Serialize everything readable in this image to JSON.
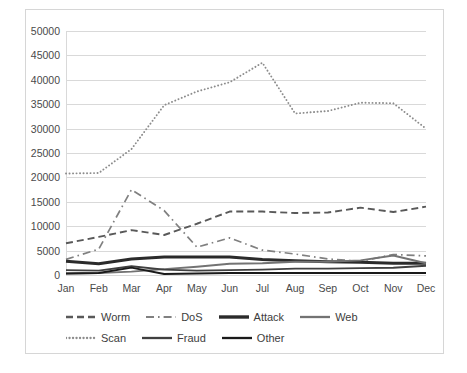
{
  "chart_data": {
    "type": "line",
    "title": "",
    "xlabel": "",
    "ylabel": "",
    "ylim": [
      0,
      50000
    ],
    "ytick_step": 5000,
    "yticks": [
      "0",
      "5000",
      "10000",
      "15000",
      "20000",
      "25000",
      "30000",
      "35000",
      "40000",
      "45000",
      "50000"
    ],
    "grid": true,
    "legend_position": "bottom",
    "categories": [
      "Jan",
      "Feb",
      "Mar",
      "Apr",
      "May",
      "Jun",
      "Jul",
      "Aug",
      "Sep",
      "Oct",
      "Nov",
      "Dec"
    ],
    "series": [
      {
        "name": "Worm",
        "style": "dashed",
        "color": "#595959",
        "values": [
          6500,
          7800,
          9200,
          8200,
          10500,
          13000,
          13000,
          12700,
          12800,
          13800,
          12900,
          14000
        ]
      },
      {
        "name": "DoS",
        "style": "dash-dot",
        "color": "#808080",
        "values": [
          3200,
          5300,
          17500,
          13200,
          5700,
          7600,
          5100,
          4300,
          3300,
          2800,
          4200,
          3900
        ]
      },
      {
        "name": "Attack",
        "style": "solid-thick",
        "color": "#2b2b2b",
        "values": [
          2800,
          2300,
          3300,
          3700,
          3700,
          3700,
          3200,
          2900,
          2700,
          2600,
          2400,
          2400
        ]
      },
      {
        "name": "Web",
        "style": "solid",
        "color": "#737373",
        "values": [
          300,
          400,
          700,
          1200,
          1700,
          2300,
          2400,
          2700,
          2700,
          3000,
          4000,
          2400
        ]
      },
      {
        "name": "Scan",
        "style": "dotted",
        "color": "#8c8c8c",
        "values": [
          20800,
          20900,
          25800,
          34800,
          37600,
          39500,
          43500,
          33100,
          33600,
          35300,
          35200,
          30000
        ]
      },
      {
        "name": "Fraud",
        "style": "solid",
        "color": "#404040",
        "values": [
          1000,
          900,
          1800,
          1100,
          900,
          1000,
          1100,
          1300,
          1300,
          1400,
          1500,
          1900
        ]
      },
      {
        "name": "Other",
        "style": "solid",
        "color": "#1a1a1a",
        "values": [
          300,
          400,
          1500,
          200,
          300,
          400,
          400,
          400,
          400,
          400,
          400,
          400
        ]
      }
    ]
  },
  "legend": {
    "rows": [
      [
        {
          "label": "Worm",
          "swatch": "dashed-swatch"
        },
        {
          "label": "DoS",
          "swatch": "dash-dot-swatch"
        },
        {
          "label": "Attack",
          "swatch": "solid-thick-swatch"
        },
        {
          "label": "Web",
          "swatch": "solid-swatch"
        }
      ],
      [
        {
          "label": "Scan",
          "swatch": "dotted-swatch"
        },
        {
          "label": "Fraud",
          "swatch": "solid-swatch"
        },
        {
          "label": "Other",
          "swatch": "solid-thick-swatch"
        }
      ]
    ]
  }
}
